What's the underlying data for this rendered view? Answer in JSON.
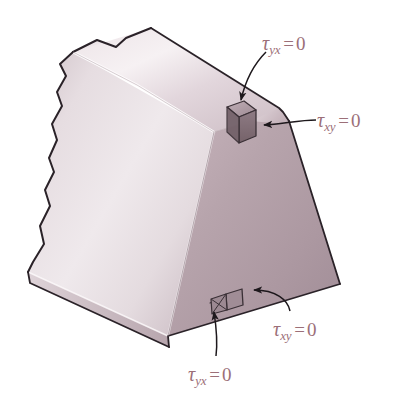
{
  "figure": {
    "background_color": "#ffffff",
    "label_color": "#9c6f78",
    "outline_color": "#262026",
    "body": {
      "top_face_color_light": "#f4eef0",
      "top_face_color_dark": "#d8ccd1",
      "left_face_color_light": "#f0e9ec",
      "left_face_color_dark": "#c3b3ba",
      "right_face_color_light": "#bda9b1",
      "right_face_color_dark": "#9d8791",
      "highlight_color": "#fdfbfc"
    },
    "cubes": [
      {
        "name": "upper-stress-element",
        "fill": "#8e7c84",
        "top_fill": "#b7a6ad"
      },
      {
        "name": "lower-stress-element",
        "fill": "#a8949c",
        "top_fill": "#c0aeb5"
      }
    ]
  },
  "labels": [
    {
      "id": "tau-yx-top",
      "symbol": "τ",
      "subscript": "yx",
      "equals": "=",
      "value": "0",
      "text": "τyx = 0",
      "x": 262,
      "y": 33
    },
    {
      "id": "tau-xy-right",
      "symbol": "τ",
      "subscript": "xy",
      "equals": "=",
      "value": "0",
      "text": "τxy = 0",
      "x": 317,
      "y": 110
    },
    {
      "id": "tau-xy-bottom",
      "symbol": "τ",
      "subscript": "xy",
      "equals": "=",
      "value": "0",
      "text": "τxy = 0",
      "x": 273,
      "y": 319
    },
    {
      "id": "tau-yx-bottom",
      "symbol": "τ",
      "subscript": "yx",
      "equals": "=",
      "value": "0",
      "text": "τyx = 0",
      "x": 188,
      "y": 364
    }
  ],
  "leaders": [
    {
      "id": "leader-tau-yx-top",
      "from_label": "tau-yx-top",
      "to_target": "upper-stress-element-top-face"
    },
    {
      "id": "leader-tau-xy-right",
      "from_label": "tau-xy-right",
      "to_target": "upper-stress-element-right-face"
    },
    {
      "id": "leader-tau-xy-bottom",
      "from_label": "tau-xy-bottom",
      "to_target": "lower-stress-element-right-face"
    },
    {
      "id": "leader-tau-yx-bottom",
      "from_label": "tau-yx-bottom",
      "to_target": "lower-stress-element-top-face"
    }
  ]
}
